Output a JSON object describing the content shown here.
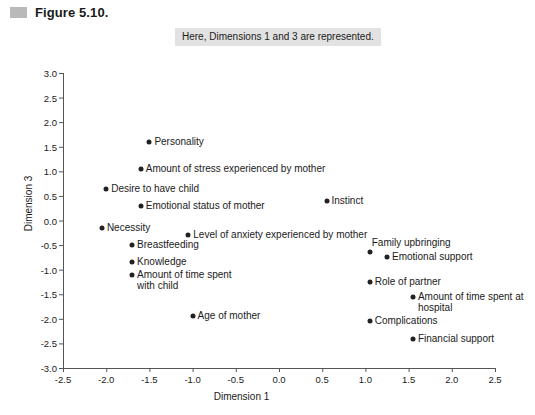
{
  "figure": {
    "marker_icon": "figure-swatch-icon",
    "title": "Figure 5.10."
  },
  "caption": {
    "text": "Here, Dimensions 1 and 3 are represented."
  },
  "colors": {
    "point": "#222222",
    "axis": "#555555",
    "caption_background": "#e2e2e2",
    "marker": "#b9b9b9"
  },
  "chart_data": {
    "type": "scatter",
    "title": "Figure 5.10.",
    "subtitle": "Here, Dimensions 1 and 3 are represented.",
    "xlabel": "Dimension 1",
    "ylabel": "Dimension 3",
    "xlim": [
      -2.5,
      2.5
    ],
    "ylim": [
      -3.0,
      3.0
    ],
    "xticks": [
      "-2.5",
      "-2.0",
      "-1.5",
      "-1.0",
      "-0.5",
      "0.0",
      "0.5",
      "1.0",
      "1.5",
      "2.0",
      "2.5"
    ],
    "yticks": [
      "3.0",
      "2.5",
      "2.0",
      "1.5",
      "1.0",
      "0.5",
      "0.0",
      "-0.5",
      "-1.0",
      "-1.5",
      "-2.0",
      "-2.5",
      "-3.0"
    ],
    "grid": false,
    "legend": "none",
    "points": [
      {
        "label": "Personality",
        "x": -1.5,
        "y": 1.6,
        "label_side": "right"
      },
      {
        "label": "Amount of stress experienced by mother",
        "x": -1.6,
        "y": 1.05,
        "label_side": "right"
      },
      {
        "label": "Desire to have child",
        "x": -2.0,
        "y": 0.65,
        "label_side": "right"
      },
      {
        "label": "Emotional status of mother",
        "x": -1.6,
        "y": 0.3,
        "label_side": "right"
      },
      {
        "label": "Necessity",
        "x": -2.05,
        "y": -0.15,
        "label_side": "right"
      },
      {
        "label": "Instinct",
        "x": 0.55,
        "y": 0.4,
        "label_side": "right"
      },
      {
        "label": "Level of anxiety experienced by mother",
        "x": -1.05,
        "y": -0.3,
        "label_side": "right"
      },
      {
        "label": "Breastfeeding",
        "x": -1.7,
        "y": -0.5,
        "label_side": "right"
      },
      {
        "label": "Knowledge",
        "x": -1.7,
        "y": -0.85,
        "label_side": "right"
      },
      {
        "label": "Amount of time spent\nwith child",
        "x": -1.7,
        "y": -1.1,
        "label_side": "right"
      },
      {
        "label": "Age of mother",
        "x": -1.0,
        "y": -1.95,
        "label_side": "right"
      },
      {
        "label": "Family upbringing",
        "x": 1.05,
        "y": -0.65,
        "label_side": "above-right"
      },
      {
        "label": "Emotional support",
        "x": 1.25,
        "y": -0.75,
        "label_side": "right"
      },
      {
        "label": "Role of partner",
        "x": 1.05,
        "y": -1.25,
        "label_side": "right"
      },
      {
        "label": "Amount of time spent at\nhospital",
        "x": 1.55,
        "y": -1.55,
        "label_side": "right"
      },
      {
        "label": "Complications",
        "x": 1.05,
        "y": -2.05,
        "label_side": "right"
      },
      {
        "label": "Financial support",
        "x": 1.55,
        "y": -2.4,
        "label_side": "right"
      }
    ]
  }
}
